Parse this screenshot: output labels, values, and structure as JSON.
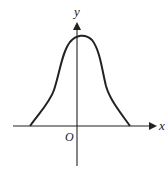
{
  "figure": {
    "type": "function-graph",
    "axes": {
      "x_label": "x",
      "y_label": "y",
      "origin_label": "O"
    },
    "colors": {
      "stroke": "#222222",
      "background": "#ffffff"
    }
  }
}
